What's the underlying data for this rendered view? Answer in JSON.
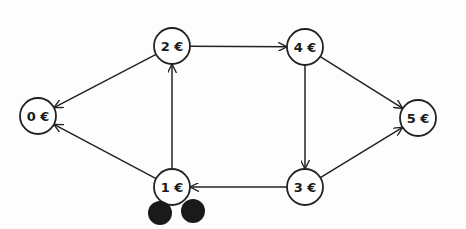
{
  "diagram": {
    "type": "directed-graph",
    "nodes": [
      {
        "id": "n0",
        "label": "0 €",
        "x": 38,
        "y": 116
      },
      {
        "id": "n1",
        "label": "1 €",
        "x": 172,
        "y": 187
      },
      {
        "id": "n2",
        "label": "2 €",
        "x": 172,
        "y": 46
      },
      {
        "id": "n3",
        "label": "3 €",
        "x": 305,
        "y": 187
      },
      {
        "id": "n4",
        "label": "4 €",
        "x": 305,
        "y": 47
      },
      {
        "id": "n5",
        "label": "5 €",
        "x": 418,
        "y": 118
      }
    ],
    "edges": [
      {
        "from": "n2",
        "to": "n0"
      },
      {
        "from": "n1",
        "to": "n0"
      },
      {
        "from": "n1",
        "to": "n2"
      },
      {
        "from": "n2",
        "to": "n4"
      },
      {
        "from": "n4",
        "to": "n5"
      },
      {
        "from": "n4",
        "to": "n3"
      },
      {
        "from": "n3",
        "to": "n5"
      },
      {
        "from": "n3",
        "to": "n1"
      }
    ],
    "tokens": [
      {
        "x": 160,
        "y": 213,
        "r": 12
      },
      {
        "x": 193,
        "y": 211,
        "r": 12
      }
    ],
    "node_radius": 18,
    "colors": {
      "stroke": "#222222",
      "fill": "#ffffff",
      "token": "#1a1a1a"
    }
  }
}
